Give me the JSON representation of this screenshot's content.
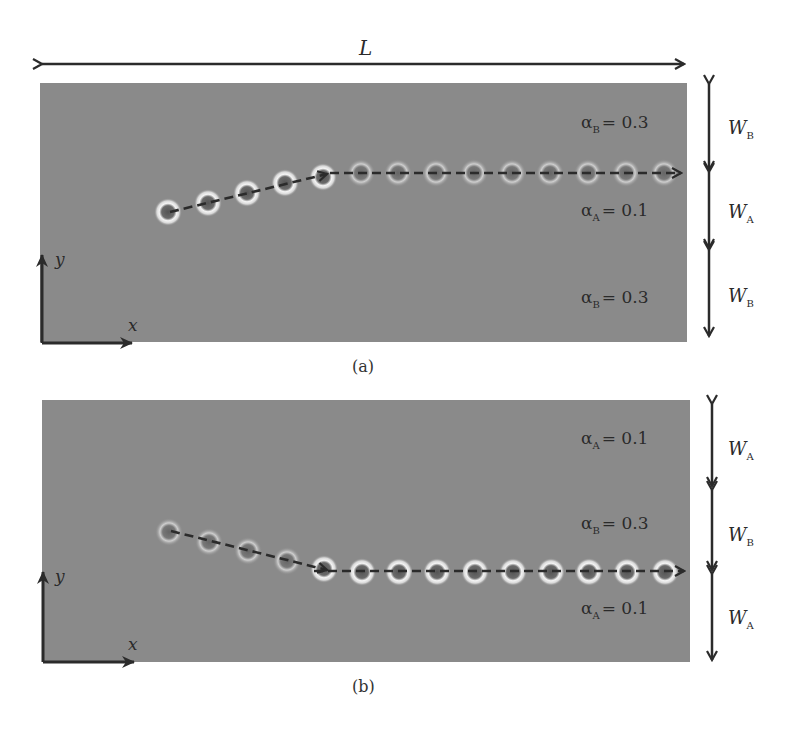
{
  "figure": {
    "length_label": "L",
    "colors": {
      "panel_fill": "#8a8a8a",
      "arrow": "#2b2b2b",
      "ring_glow": "#f2f2f2",
      "core": "#5a5a5a",
      "text": "#2a2a2a"
    },
    "panels": [
      {
        "id": "a",
        "caption": "(a)",
        "axes": {
          "x_label": "x",
          "y_label": "y"
        },
        "regions": [
          {
            "symbol": "α",
            "subscript": "B",
            "equals": "= 0.3",
            "width_label": "W",
            "width_sub": "B"
          },
          {
            "symbol": "α",
            "subscript": "A",
            "equals": "= 0.1",
            "width_label": "W",
            "width_sub": "A"
          },
          {
            "symbol": "α",
            "subscript": "B",
            "equals": "= 0.3",
            "width_label": "W",
            "width_sub": "B"
          }
        ],
        "trajectory": "rises from lower-left into the A/B interface then travels horizontally along the interface",
        "skyrmion_count": 14
      },
      {
        "id": "b",
        "caption": "(b)",
        "axes": {
          "x_label": "x",
          "y_label": "y"
        },
        "regions": [
          {
            "symbol": "α",
            "subscript": "A",
            "equals": "= 0.1",
            "width_label": "W",
            "width_sub": "A"
          },
          {
            "symbol": "α",
            "subscript": "B",
            "equals": "= 0.3",
            "width_label": "W",
            "width_sub": "B"
          },
          {
            "symbol": "α",
            "subscript": "A",
            "equals": "= 0.1",
            "width_label": "W",
            "width_sub": "A"
          }
        ],
        "trajectory": "descends from upper-left into the B/A interface then travels horizontally along the interface",
        "skyrmion_count": 14
      }
    ]
  }
}
